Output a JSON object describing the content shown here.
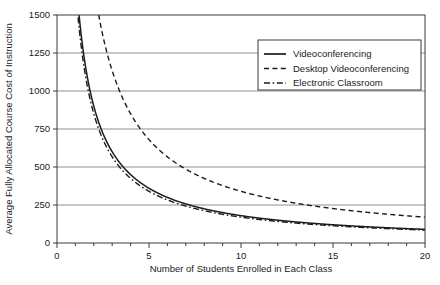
{
  "chart_data": {
    "type": "line",
    "title": "",
    "subtitle": "",
    "xlabel": "Number of Students Enrolled in Each Class",
    "ylabel": "Average Fully Allocated Course Cost of Instruction",
    "xlim": [
      0,
      20
    ],
    "ylim": [
      0,
      1500
    ],
    "xticks": [
      0,
      5,
      10,
      15,
      20
    ],
    "xtick_labels": [
      "0",
      "5",
      "10",
      "15",
      "20"
    ],
    "xminor_tick_interval": 1,
    "yticks": [
      0,
      250,
      500,
      750,
      1000,
      1250,
      1500
    ],
    "ytick_labels": [
      "0",
      "250",
      "500",
      "750",
      "1000",
      "1250",
      "1500"
    ],
    "grid": "horizontal",
    "legend_position": "upper-right",
    "x": [
      1,
      1.2,
      1.5,
      2,
      2.5,
      3,
      3.5,
      4,
      4.5,
      5,
      6,
      7,
      8,
      9,
      10,
      11,
      12,
      13,
      14,
      15,
      16,
      17,
      18,
      19,
      20
    ],
    "series": [
      {
        "name": "Videoconferencing",
        "linestyle": "solid",
        "color": "#1b1b1b",
        "formula_constant": 1800,
        "values": [
          1800,
          1500,
          1200,
          900,
          720,
          600,
          514,
          450,
          400,
          360,
          300,
          257,
          225,
          200,
          180,
          164,
          150,
          138,
          129,
          120,
          113,
          106,
          100,
          95,
          90
        ]
      },
      {
        "name": "Desktop  Videoconferencing",
        "linestyle": "dashed",
        "color": "#1b1b1b",
        "formula_constant": 3400,
        "values": [
          3400,
          2833,
          2267,
          1700,
          1360,
          1133,
          971,
          850,
          756,
          680,
          567,
          486,
          425,
          378,
          340,
          309,
          283,
          262,
          243,
          227,
          213,
          200,
          189,
          179,
          170
        ]
      },
      {
        "name": "Electronic Classroom",
        "linestyle": "dashdot",
        "color": "#1b1b1b",
        "formula_constant": 1700,
        "values": [
          1700,
          1417,
          1133,
          850,
          680,
          567,
          486,
          425,
          378,
          340,
          283,
          243,
          213,
          189,
          170,
          155,
          142,
          131,
          121,
          113,
          106,
          100,
          94,
          89,
          85
        ]
      }
    ]
  },
  "axes": {
    "y_title": "Average Fully Allocated Course Cost of Instruction",
    "x_title": "Number of Students Enrolled in Each Class",
    "y_tick_labels": [
      "1500",
      "1250",
      "1000",
      "750",
      "500",
      "250",
      "0"
    ],
    "x_tick_labels": [
      "0",
      "5",
      "10",
      "15",
      "20"
    ]
  },
  "legend": {
    "items": [
      {
        "label": "Videoconferencing",
        "style": "solid"
      },
      {
        "label": "Desktop  Videoconferencing",
        "style": "dashed"
      },
      {
        "label": "Electronic Classroom",
        "style": "dashdot"
      }
    ]
  },
  "style": {
    "ink": "#1b1b1b",
    "grid": "#8f8f8f",
    "frame": "#3a3a3a",
    "background": "#ffffff"
  }
}
